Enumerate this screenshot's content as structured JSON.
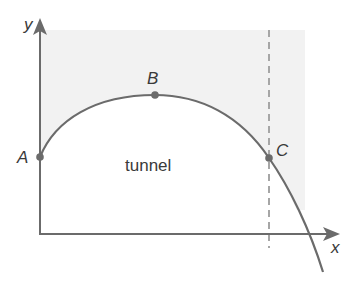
{
  "diagram": {
    "axes": {
      "x_label": "x",
      "y_label": "y"
    },
    "region_label": "tunnel",
    "points": [
      {
        "name": "A",
        "label": "A",
        "description": "curve meets y-axis"
      },
      {
        "name": "B",
        "label": "B",
        "description": "highest point of curve"
      },
      {
        "name": "C",
        "label": "C",
        "description": "curve meets dashed vertical line"
      }
    ],
    "dashed_line": "vertical line through C",
    "colors": {
      "axis": "#6b6b6b",
      "curve": "#6b6b6b",
      "shading": "#f2f2f2",
      "dashed_line": "#a6a6a6",
      "text": "#3a3a3a"
    }
  }
}
